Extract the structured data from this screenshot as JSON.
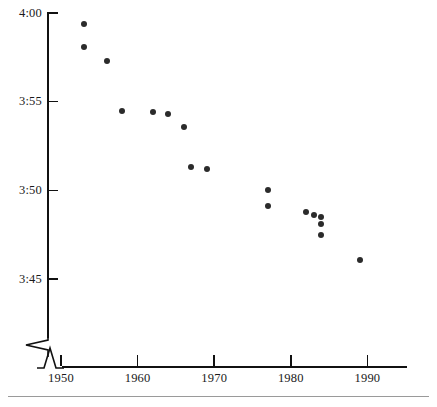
{
  "chart_data": {
    "type": "scatter",
    "title": "",
    "subtitle": "",
    "xlabel": "",
    "ylabel": "",
    "xlim": [
      1950,
      1990
    ],
    "ylim": [
      225,
      240
    ],
    "grid": false,
    "legend": null,
    "x_ticks": [
      1950,
      1960,
      1970,
      1980,
      1990
    ],
    "x_tick_labels": [
      "1950",
      "1960",
      "1970",
      "1980",
      "1990"
    ],
    "y_ticks": [
      240,
      235,
      230,
      225
    ],
    "y_tick_labels": [
      "4:00",
      "3:55",
      "3:50",
      "3:45"
    ],
    "axis_break": {
      "x_axis": true,
      "y_axis": true,
      "symbol": "zigzag"
    },
    "marker": {
      "shape": "circle",
      "color": "#2b2b2b",
      "size_px": 6
    },
    "series": [
      {
        "name": "Mile record time",
        "points": [
          {
            "x": 1953,
            "y": 239.4,
            "label": "3:59.4"
          },
          {
            "x": 1953,
            "y": 238.1,
            "label": "3:58.1"
          },
          {
            "x": 1956,
            "y": 237.3,
            "label": "3:57.3"
          },
          {
            "x": 1958,
            "y": 234.5,
            "label": "3:54.5"
          },
          {
            "x": 1962,
            "y": 234.4,
            "label": "3:54.4"
          },
          {
            "x": 1964,
            "y": 234.3,
            "label": "3:54.3"
          },
          {
            "x": 1966,
            "y": 233.6,
            "label": "3:53.6"
          },
          {
            "x": 1967,
            "y": 231.3,
            "label": "3:51.3"
          },
          {
            "x": 1969,
            "y": 231.2,
            "label": "3:51.2"
          },
          {
            "x": 1977,
            "y": 230.0,
            "label": "3:50.0"
          },
          {
            "x": 1977,
            "y": 229.1,
            "label": "3:49.1"
          },
          {
            "x": 1982,
            "y": 228.8,
            "label": "3:48.8"
          },
          {
            "x": 1983,
            "y": 228.6,
            "label": "3:48.6"
          },
          {
            "x": 1984,
            "y": 228.5,
            "label": "3:48.5"
          },
          {
            "x": 1984,
            "y": 228.1,
            "label": "3:48.1"
          },
          {
            "x": 1984,
            "y": 227.5,
            "label": "3:47.5"
          },
          {
            "x": 1989,
            "y": 226.1,
            "label": "3:46.1"
          }
        ]
      }
    ]
  },
  "colors": {
    "marker": "#2b2b2b",
    "axis": "#111111",
    "rule": "#9a9a9a",
    "background": "#ffffff"
  }
}
